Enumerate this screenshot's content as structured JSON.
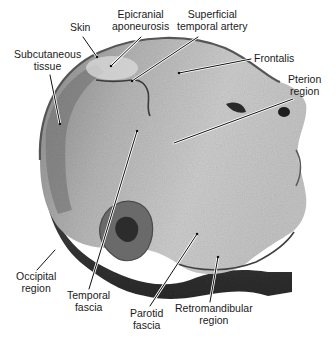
{
  "figure": {
    "colors": {
      "background": "#ffffff",
      "tissue_light": "#cfcfcf",
      "tissue_mid": "#9a9a9a",
      "tissue_dark": "#3a3a3a",
      "skin_edge": "#555555",
      "leader_line": "#111111",
      "label_text": "#1a1a1a"
    }
  },
  "labels": [
    {
      "id": "skin",
      "lines": [
        "Skin"
      ]
    },
    {
      "id": "epicranial-aponeurosis",
      "lines": [
        "Epicranial",
        "aponeurosis"
      ]
    },
    {
      "id": "superficial-temporal-artery",
      "lines": [
        "Superficial",
        "temporal artery"
      ]
    },
    {
      "id": "subcutaneous-tissue",
      "lines": [
        "Subcutaneous",
        "tissue"
      ]
    },
    {
      "id": "frontalis",
      "lines": [
        "Frontalis"
      ]
    },
    {
      "id": "pterion-region",
      "lines": [
        "Pterion",
        "region"
      ]
    },
    {
      "id": "occipital-region",
      "lines": [
        "Occipital",
        "region"
      ]
    },
    {
      "id": "temporal-fascia",
      "lines": [
        "Temporal",
        "fascia"
      ]
    },
    {
      "id": "parotid-fascia",
      "lines": [
        "Parotid",
        "fascia"
      ]
    },
    {
      "id": "retromandibular-region",
      "lines": [
        "Retromandibular",
        "region"
      ]
    }
  ]
}
